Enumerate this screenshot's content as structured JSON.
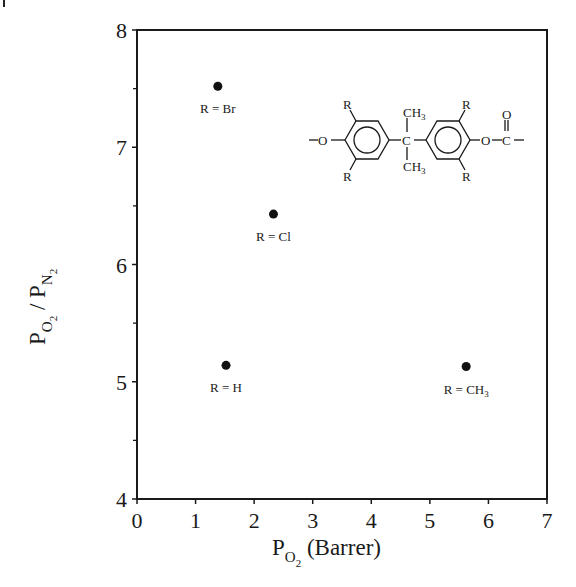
{
  "chart_data": {
    "type": "scatter",
    "title": "",
    "xlabel": "P_O2 (Barrer)",
    "ylabel": "P_O2 / P_N2",
    "xlabel_parts": {
      "main": "P",
      "sub": "O",
      "subsub": "2",
      "rest": " (Barrer)"
    },
    "ylabel_parts": {
      "p1": "P",
      "s1": "O",
      "ss1": "2",
      "slash": " / ",
      "p2": "P",
      "s2": "N",
      "ss2": "2"
    },
    "xlim": [
      0,
      7
    ],
    "ylim": [
      4,
      8
    ],
    "x_ticks": [
      0,
      1,
      2,
      3,
      4,
      5,
      6,
      7
    ],
    "y_ticks": [
      4,
      5,
      6,
      7,
      8
    ],
    "y_minor_ticks": [
      4.5,
      5.5,
      6.5,
      7.5
    ],
    "grid": false,
    "legend": null,
    "points": [
      {
        "label": "R = Br",
        "label_main": "R = Br",
        "label_sub": "",
        "x": 1.38,
        "y": 7.52
      },
      {
        "label": "R = Cl",
        "label_main": "R = Cl",
        "label_sub": "",
        "x": 2.33,
        "y": 6.43
      },
      {
        "label": "R = H",
        "label_main": "R = H",
        "label_sub": "",
        "x": 1.52,
        "y": 5.14
      },
      {
        "label": "R = CH3",
        "label_main": "R = CH",
        "label_sub": "3",
        "x": 5.62,
        "y": 5.13
      }
    ],
    "annotation": {
      "type": "chemical-structure",
      "description": "Polycarbonate repeat unit: -O-Ar(R,R)-C(CH3)2-Ar(R,R)-O-C(=O)-",
      "labels": {
        "R": "R",
        "O": "O",
        "C": "C",
        "CH": "CH",
        "three": "3",
        "dash": "-"
      }
    }
  }
}
